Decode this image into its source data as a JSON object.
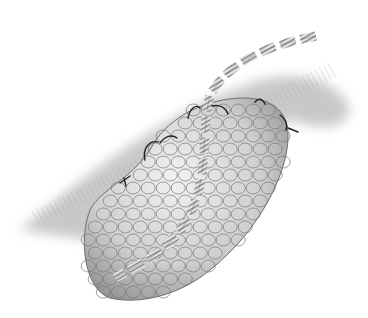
{
  "image": {
    "subject": "surgical illustration of a lobulated mass sutured to surrounding tissue with a striped band (tape) passing over it",
    "style": "grayscale pencil/airbrush drawing",
    "colors": {
      "background": "#ffffff",
      "mass_fill": "#d8d8d8",
      "mass_shadow": "#8c8c8c",
      "lobule_outline": "#6e6e6e",
      "tissue_hatch": "#9a9a9a",
      "suture": "#2a2a2a",
      "band_stripe": "#7a7a7a"
    },
    "elements": [
      "tissue-background",
      "lobulated-mass",
      "striped-band",
      "sutures"
    ]
  }
}
